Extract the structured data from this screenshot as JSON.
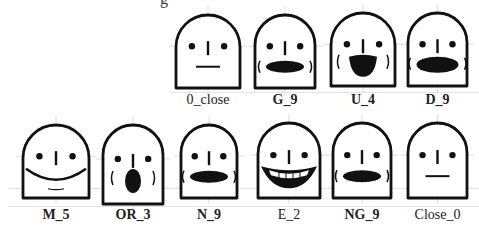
{
  "figure": {
    "top_cut_text": "g",
    "ink_color": "#111111",
    "rows": [
      {
        "faces": [
          {
            "id": "0_close",
            "label": "0_close",
            "bold": false,
            "mouth": "line",
            "x": 173,
            "y": 12,
            "w": 70,
            "h": 76
          },
          {
            "id": "G_9",
            "label": "G_9",
            "bold": true,
            "mouth": "oval",
            "x": 252,
            "y": 12,
            "w": 66,
            "h": 76
          },
          {
            "id": "U_4",
            "label": "U_4",
            "bold": true,
            "mouth": "round-open",
            "x": 328,
            "y": 10,
            "w": 70,
            "h": 76
          },
          {
            "id": "D_9",
            "label": "D_9",
            "bold": true,
            "mouth": "wide-oval",
            "x": 405,
            "y": 10,
            "w": 65,
            "h": 76
          }
        ]
      },
      {
        "faces": [
          {
            "id": "M_5",
            "label": "M_5",
            "bold": true,
            "mouth": "smile",
            "x": 20,
            "y": 122,
            "w": 72,
            "h": 76
          },
          {
            "id": "OR_3",
            "label": "OR_3",
            "bold": true,
            "mouth": "o-round",
            "x": 100,
            "y": 122,
            "w": 66,
            "h": 82
          },
          {
            "id": "N_9",
            "label": "N_9",
            "bold": true,
            "mouth": "oval",
            "x": 178,
            "y": 122,
            "w": 62,
            "h": 76
          },
          {
            "id": "E_2",
            "label": "E_2",
            "bold": false,
            "mouth": "teeth-grin",
            "x": 255,
            "y": 120,
            "w": 68,
            "h": 78
          },
          {
            "id": "NG_9",
            "label": "NG_9",
            "bold": true,
            "mouth": "oval",
            "x": 330,
            "y": 120,
            "w": 64,
            "h": 78
          },
          {
            "id": "Close_0",
            "label": "Close_0",
            "bold": false,
            "mouth": "line",
            "x": 405,
            "y": 120,
            "w": 65,
            "h": 78
          }
        ]
      }
    ]
  }
}
